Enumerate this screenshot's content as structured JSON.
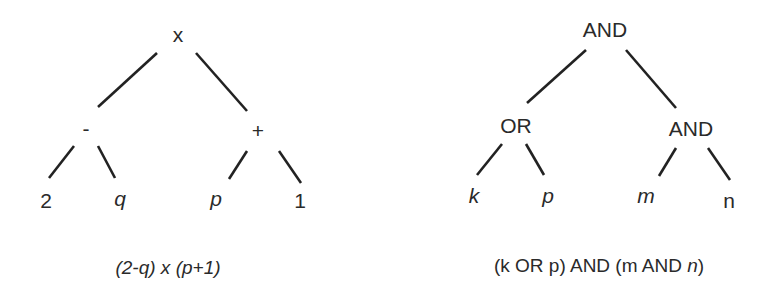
{
  "diagrams": [
    {
      "name": "arithmetic-expression-tree",
      "root": "x",
      "nodes": {
        "root": {
          "label": "x",
          "italic": false
        },
        "left": {
          "label": "-",
          "italic": false
        },
        "right": {
          "label": "+",
          "italic": false
        },
        "ll": {
          "label": "2",
          "italic": false
        },
        "lr": {
          "label": "q",
          "italic": true
        },
        "rl": {
          "label": "p",
          "italic": true
        },
        "rr": {
          "label": "1",
          "italic": false
        }
      },
      "edges": [
        [
          "x",
          "-"
        ],
        [
          "x",
          "+"
        ],
        [
          "-",
          "2"
        ],
        [
          "-",
          "q"
        ],
        [
          "+",
          "p"
        ],
        [
          "+",
          "1"
        ]
      ],
      "caption": {
        "parts": [
          "(2-q) x (p+1)"
        ]
      }
    },
    {
      "name": "boolean-expression-tree",
      "root": "AND",
      "nodes": {
        "root": {
          "label": "AND",
          "italic": false
        },
        "left": {
          "label": "OR",
          "italic": false
        },
        "right": {
          "label": "AND",
          "italic": false
        },
        "ll": {
          "label": "k",
          "italic": true
        },
        "lr": {
          "label": "p",
          "italic": true
        },
        "rl": {
          "label": "m",
          "italic": true
        },
        "rr": {
          "label": "n",
          "italic": false
        }
      },
      "edges": [
        [
          "AND",
          "OR"
        ],
        [
          "AND",
          "AND"
        ],
        [
          "OR",
          "k"
        ],
        [
          "OR",
          "p"
        ],
        [
          "AND",
          "m"
        ],
        [
          "AND",
          "n"
        ]
      ],
      "caption": {
        "parts": [
          "(k OR p) AND (m AND ",
          "n",
          ")"
        ]
      }
    }
  ]
}
